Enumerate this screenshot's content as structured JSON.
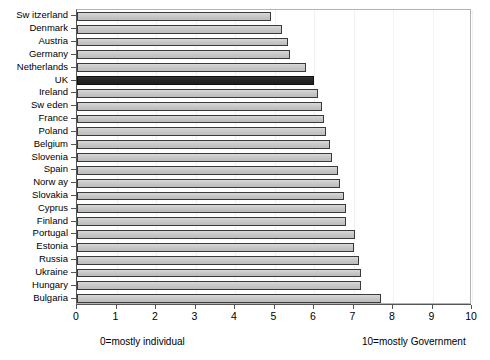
{
  "chart_data": {
    "type": "bar",
    "orientation": "horizontal",
    "title": "",
    "subtitle": "",
    "xlabel": "",
    "ylabel": "",
    "xlim": [
      0,
      10
    ],
    "ylim": null,
    "grid": "vertical-faint",
    "legend": null,
    "xticks": [
      0,
      1,
      2,
      3,
      4,
      5,
      6,
      7,
      8,
      9,
      10
    ],
    "xticklabels": [
      "0",
      "1",
      "2",
      "3",
      "4",
      "5",
      "6",
      "7",
      "8",
      "9",
      "10"
    ],
    "categories": [
      "Switzerland",
      "Denmark",
      "Austria",
      "Germany",
      "Netherlands",
      "UK",
      "Ireland",
      "Sweden",
      "France",
      "Poland",
      "Belgium",
      "Slovenia",
      "Spain",
      "Norway",
      "Slovakia",
      "Cyprus",
      "Finland",
      "Portugal",
      "Estonia",
      "Russia",
      "Ukraine",
      "Hungary",
      "Bulgaria"
    ],
    "category_labels_as_drawn": [
      "Sw itzerland",
      "Denmark",
      "Austria",
      "Germany",
      "Netherlands",
      "UK",
      "Ireland",
      "Sw eden",
      "France",
      "Poland",
      "Belgium",
      "Slovenia",
      "Spain",
      "Norw ay",
      "Slovakia",
      "Cyprus",
      "Finland",
      "Portugal",
      "Estonia",
      "Russia",
      "Ukraine",
      "Hungary",
      "Bulgaria"
    ],
    "values": [
      4.9,
      5.2,
      5.35,
      5.4,
      5.8,
      6.0,
      6.1,
      6.2,
      6.25,
      6.3,
      6.4,
      6.45,
      6.6,
      6.65,
      6.75,
      6.8,
      6.8,
      7.05,
      7.0,
      7.15,
      7.2,
      7.2,
      7.7
    ],
    "highlight_category": "UK",
    "annotations": [
      {
        "name": "left-anchor-note",
        "text": "0=mostly individual"
      },
      {
        "name": "right-anchor-note",
        "text": "10=mostly Government"
      }
    ],
    "colors": {
      "bar_fill": "#c8c8c8",
      "bar_edge": "#3a3a3a",
      "highlight_fill": "#262626",
      "axis": "#555555",
      "plot_border": "#b4b4b4",
      "gridline": "#f2f2f2",
      "background": "#ffffff",
      "text": "#000000"
    }
  }
}
